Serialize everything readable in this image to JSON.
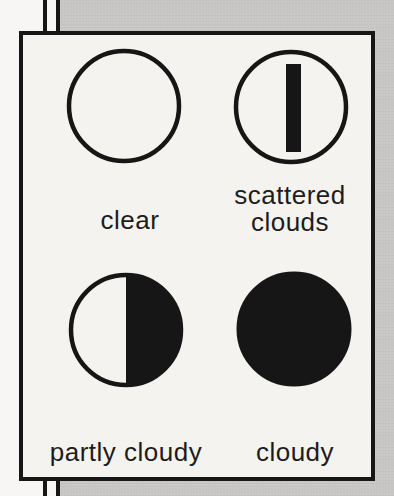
{
  "figure": {
    "kind": "cloud-cover legend",
    "items": [
      {
        "label": "clear",
        "symbol": "clear-symbol",
        "shape": "empty circle"
      },
      {
        "label": "scattered clouds",
        "symbol": "scattered-clouds-symbol",
        "shape": "circle with vertical bar"
      },
      {
        "label": "partly cloudy",
        "symbol": "partly-cloudy-symbol",
        "shape": "circle with right half filled"
      },
      {
        "label": "cloudy",
        "symbol": "cloudy-symbol",
        "shape": "solid filled circle"
      }
    ]
  },
  "colors": {
    "ink": "#161616",
    "text": "#1d1c1b",
    "paper": "#f4f3f0",
    "page_white": "#f7f6f4",
    "gray": "#c8c7c5"
  }
}
